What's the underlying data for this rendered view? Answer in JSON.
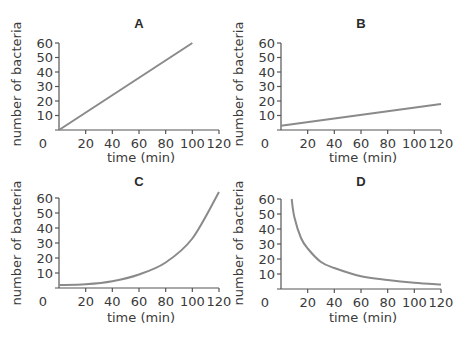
{
  "chart_data": [
    {
      "panel": "A",
      "type": "line",
      "title": "A",
      "xlabel": "time (min)",
      "ylabel": "number of bacteria",
      "xlim": [
        0,
        120
      ],
      "ylim": [
        0,
        60
      ],
      "xticks": [
        "0",
        "20",
        "40",
        "60",
        "80",
        "100",
        "120"
      ],
      "yticks": [
        "10",
        "20",
        "30",
        "40",
        "50",
        "60"
      ],
      "grid": false,
      "series": [
        {
          "name": "A",
          "x": [
            0,
            20,
            40,
            60,
            80,
            100
          ],
          "values": [
            0,
            12,
            24,
            36,
            48,
            60
          ]
        }
      ]
    },
    {
      "panel": "B",
      "type": "line",
      "title": "B",
      "xlabel": "time (min)",
      "ylabel": "number of bacteria",
      "xlim": [
        0,
        120
      ],
      "ylim": [
        0,
        60
      ],
      "xticks": [
        "0",
        "20",
        "40",
        "60",
        "80",
        "100",
        "120"
      ],
      "yticks": [
        "10",
        "20",
        "30",
        "40",
        "50",
        "60"
      ],
      "grid": false,
      "series": [
        {
          "name": "B",
          "x": [
            0,
            20,
            40,
            60,
            80,
            100,
            120
          ],
          "values": [
            3,
            5.5,
            8,
            10.5,
            13,
            15.5,
            18
          ]
        }
      ]
    },
    {
      "panel": "C",
      "type": "line",
      "title": "C",
      "xlabel": "time (min)",
      "ylabel": "number of bacteria",
      "xlim": [
        0,
        120
      ],
      "ylim": [
        0,
        60
      ],
      "xticks": [
        "0",
        "20",
        "40",
        "60",
        "80",
        "100",
        "120"
      ],
      "yticks": [
        "10",
        "20",
        "30",
        "40",
        "50",
        "60"
      ],
      "grid": false,
      "series": [
        {
          "name": "C",
          "x": [
            0,
            20,
            40,
            60,
            80,
            100,
            120
          ],
          "values": [
            2,
            2.5,
            4.5,
            9,
            17,
            33,
            64
          ]
        }
      ]
    },
    {
      "panel": "D",
      "type": "line",
      "title": "D",
      "xlabel": "time (min)",
      "ylabel": "number of bacteria",
      "xlim": [
        0,
        120
      ],
      "ylim": [
        0,
        60
      ],
      "xticks": [
        "0",
        "20",
        "40",
        "60",
        "80",
        "100",
        "120"
      ],
      "yticks": [
        "10",
        "20",
        "30",
        "40",
        "50",
        "60"
      ],
      "grid": false,
      "series": [
        {
          "name": "D",
          "x": [
            8,
            10,
            15,
            20,
            30,
            40,
            60,
            80,
            100,
            120
          ],
          "values": [
            60,
            48,
            34,
            27,
            18,
            14,
            8.5,
            6,
            4.2,
            3
          ]
        }
      ]
    }
  ],
  "colors": {
    "curve": "#8a8a8a",
    "axis": "#555555",
    "text": "#3a3a3a"
  }
}
